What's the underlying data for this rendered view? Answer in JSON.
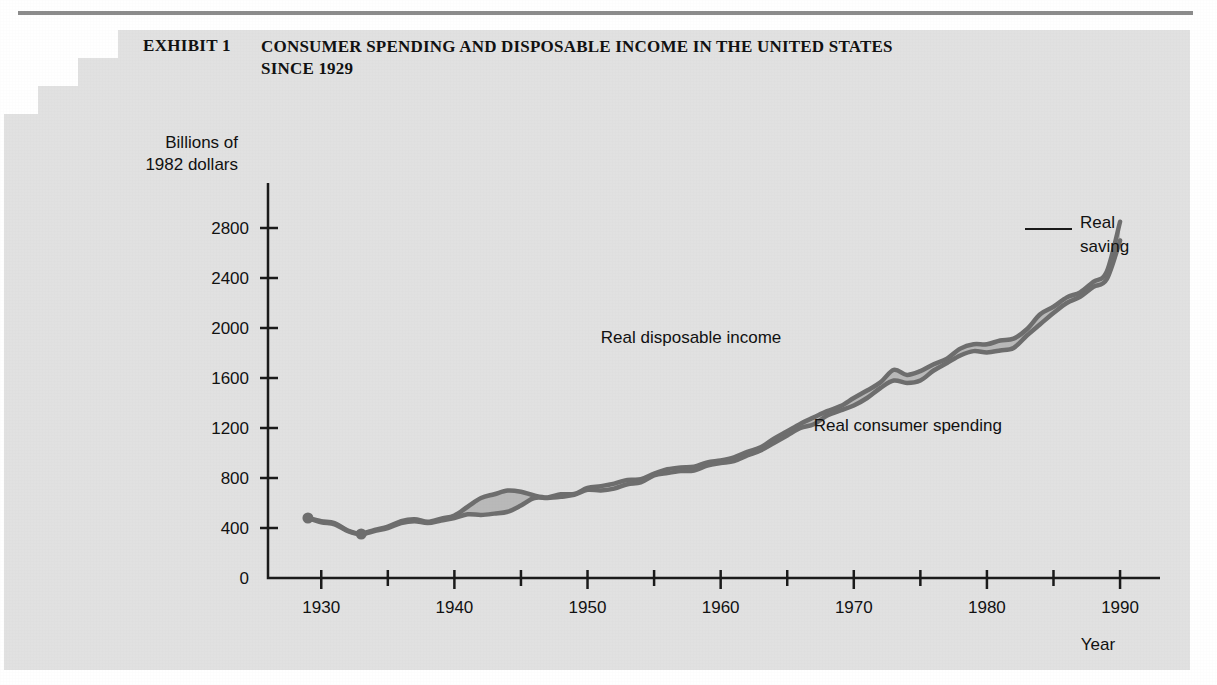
{
  "exhibit": {
    "label": "EXHIBIT 1",
    "title": "CONSUMER SPENDING AND DISPOSABLE INCOME IN THE UNITED STATES SINCE 1929"
  },
  "colors": {
    "panel": "#e1e1e1",
    "page": "#ffffff",
    "rule": "#8c8c8c",
    "line": "#6e6e6e",
    "band_fill": "#b9b9b9",
    "axis": "#1a1a1a",
    "text": "#111111"
  },
  "chart_data": {
    "type": "area",
    "title": "CONSUMER SPENDING AND DISPOSABLE INCOME IN THE UNITED STATES SINCE 1929",
    "xlabel": "Year",
    "ylabel": "Billions of 1982 dollars",
    "ylabel_line1": "Billions of",
    "ylabel_line2": "1982 dollars",
    "xlim": [
      1926,
      1993
    ],
    "ylim": [
      0,
      3000
    ],
    "yticks": [
      0,
      400,
      800,
      1200,
      1600,
      2000,
      2400,
      2800
    ],
    "ytick_labels": [
      "0",
      "400",
      "800",
      "1200",
      "1600",
      "2000",
      "2400",
      "2800"
    ],
    "xticks": [
      1930,
      1940,
      1950,
      1960,
      1970,
      1980,
      1990
    ],
    "xtick_labels": [
      "1930",
      "1940",
      "1950",
      "1960",
      "1970",
      "1980",
      "1990"
    ],
    "xminor_ticks": [
      1935,
      1945,
      1955,
      1965,
      1975,
      1985
    ],
    "grid": false,
    "legend_position": "inline-annotations",
    "annotations": [
      {
        "name": "real-disposable-income-label",
        "text": "Real disposable income",
        "x": 1951,
        "y": 1880
      },
      {
        "name": "real-consumer-spending-label",
        "text": "Real consumer spending",
        "x": 1967,
        "y": 1180
      },
      {
        "name": "real-saving-label",
        "text": "Real saving",
        "line1": "Real",
        "line2": "saving",
        "x": 1992,
        "y": 2800
      }
    ],
    "x": [
      1929,
      1930,
      1931,
      1932,
      1933,
      1934,
      1935,
      1936,
      1937,
      1938,
      1939,
      1940,
      1941,
      1942,
      1943,
      1944,
      1945,
      1946,
      1947,
      1948,
      1949,
      1950,
      1951,
      1952,
      1953,
      1954,
      1955,
      1956,
      1957,
      1958,
      1959,
      1960,
      1961,
      1962,
      1963,
      1964,
      1965,
      1966,
      1967,
      1968,
      1969,
      1970,
      1971,
      1972,
      1973,
      1974,
      1975,
      1976,
      1977,
      1978,
      1979,
      1980,
      1981,
      1982,
      1983,
      1984,
      1985,
      1986,
      1987,
      1988,
      1989,
      1990
    ],
    "series": [
      {
        "name": "Real disposable income",
        "values": [
          480,
          455,
          440,
          380,
          355,
          385,
          410,
          455,
          470,
          450,
          475,
          500,
          570,
          640,
          670,
          700,
          690,
          660,
          645,
          670,
          672,
          720,
          735,
          755,
          785,
          790,
          835,
          870,
          885,
          890,
          925,
          940,
          965,
          1010,
          1045,
          1115,
          1175,
          1235,
          1285,
          1335,
          1375,
          1440,
          1500,
          1565,
          1665,
          1625,
          1655,
          1710,
          1755,
          1835,
          1870,
          1870,
          1900,
          1915,
          1990,
          2110,
          2170,
          2245,
          2285,
          2370,
          2450,
          2850
        ]
      },
      {
        "name": "Real consumer spending",
        "values": [
          480,
          445,
          430,
          375,
          350,
          375,
          400,
          440,
          455,
          440,
          460,
          480,
          510,
          505,
          515,
          530,
          580,
          640,
          640,
          650,
          665,
          705,
          700,
          715,
          750,
          765,
          820,
          840,
          855,
          860,
          900,
          920,
          935,
          980,
          1020,
          1080,
          1140,
          1200,
          1230,
          1300,
          1340,
          1380,
          1440,
          1520,
          1580,
          1560,
          1580,
          1660,
          1720,
          1780,
          1815,
          1805,
          1820,
          1840,
          1940,
          2030,
          2120,
          2200,
          2250,
          2330,
          2390,
          2700
        ]
      }
    ],
    "marker_points": [
      {
        "name": "start-point-1929",
        "x": 1929,
        "y": 480
      },
      {
        "name": "trough-point-1933",
        "x": 1933,
        "y": 352
      }
    ]
  }
}
